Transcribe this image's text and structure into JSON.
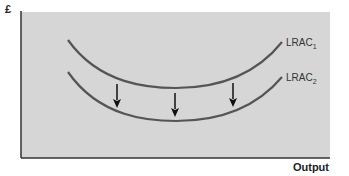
{
  "diagram": {
    "y_axis_label": "£",
    "x_axis_label": "Output",
    "background_color": "#d6d6d6",
    "curve_color": "#555555",
    "curves": [
      {
        "name": "LRAC",
        "subscript": "1",
        "label": "LRAC1"
      },
      {
        "name": "LRAC",
        "subscript": "2",
        "label": "LRAC2"
      }
    ],
    "arrows": [
      {
        "direction": "down",
        "meaning": "cost curve shifts downward"
      },
      {
        "direction": "down",
        "meaning": "cost curve shifts downward"
      },
      {
        "direction": "down",
        "meaning": "cost curve shifts downward"
      }
    ]
  }
}
